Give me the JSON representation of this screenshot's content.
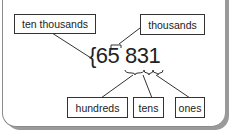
{
  "diagram": {
    "number": "65831",
    "brace": "{",
    "digits": [
      "6",
      "5",
      "8",
      "3",
      "1"
    ],
    "labels": {
      "ten_thousands": "ten thousands",
      "thousands": "thousands",
      "hundreds": "hundreds",
      "tens": "tens",
      "ones": "ones"
    }
  }
}
